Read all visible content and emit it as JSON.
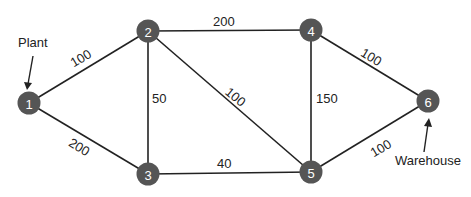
{
  "diagram": {
    "type": "network",
    "nodes": [
      {
        "id": "1",
        "label": "1",
        "x": 29,
        "y": 103
      },
      {
        "id": "2",
        "label": "2",
        "x": 148,
        "y": 31
      },
      {
        "id": "3",
        "label": "3",
        "x": 148,
        "y": 174
      },
      {
        "id": "4",
        "label": "4",
        "x": 311,
        "y": 30
      },
      {
        "id": "5",
        "label": "5",
        "x": 311,
        "y": 172
      },
      {
        "id": "6",
        "label": "6",
        "x": 428,
        "y": 101
      }
    ],
    "edges": [
      {
        "from": "1",
        "to": "2",
        "weight": "100"
      },
      {
        "from": "1",
        "to": "3",
        "weight": "200"
      },
      {
        "from": "2",
        "to": "3",
        "weight": "50"
      },
      {
        "from": "2",
        "to": "4",
        "weight": "200"
      },
      {
        "from": "2",
        "to": "5",
        "weight": "100"
      },
      {
        "from": "3",
        "to": "5",
        "weight": "40"
      },
      {
        "from": "4",
        "to": "5",
        "weight": "150"
      },
      {
        "from": "4",
        "to": "6",
        "weight": "100"
      },
      {
        "from": "5",
        "to": "6",
        "weight": "100"
      }
    ],
    "annotations": {
      "source": {
        "label": "Plant",
        "node": "1"
      },
      "sink": {
        "label": "Warehouse",
        "node": "6"
      }
    },
    "colors": {
      "node_fill": "#555555",
      "node_text": "#ffffff",
      "edge": "#222222"
    }
  }
}
